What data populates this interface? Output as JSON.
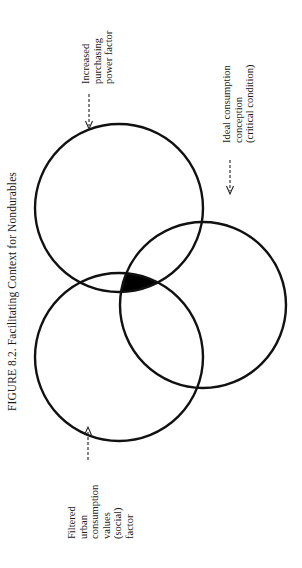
{
  "figure": {
    "title": "FIGURE 8.2. Facilitating Context for Nondurables",
    "orientation": "rotated -90deg (landscape page)"
  },
  "diagram": {
    "type": "venn",
    "circles": [
      {
        "id": "purchasing-power",
        "label_lines": [
          "Increased",
          "purchasing",
          "power factor"
        ]
      },
      {
        "id": "ideal-consumption",
        "label_lines": [
          "Ideal consumption",
          "conception",
          "(critical condition)"
        ]
      },
      {
        "id": "urban-consumption",
        "label_lines": [
          "Filtered",
          "urban",
          "consumption",
          "values",
          "(social)",
          "factor"
        ]
      }
    ],
    "intersection": {
      "shaded": true,
      "fill": "#000000"
    },
    "line_color": "#111111"
  }
}
